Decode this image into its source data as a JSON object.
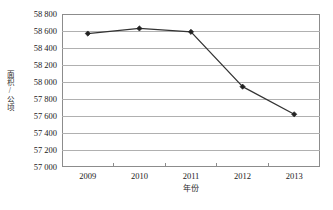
{
  "chart_data": {
    "type": "line",
    "title": "",
    "subtitle": "",
    "xlabel": "年份",
    "ylabel": "面积/公顷",
    "categories": [
      "2009",
      "2010",
      "2011",
      "2012",
      "2013"
    ],
    "x": [
      2009,
      2010,
      2011,
      2012,
      2013
    ],
    "series": [
      {
        "name": "面积",
        "values": [
          58570,
          58630,
          58590,
          57945,
          57620
        ],
        "color": "#333333",
        "marker": "diamond",
        "marker_color": "#222222"
      }
    ],
    "values": [
      58570,
      58630,
      58590,
      57945,
      57620
    ],
    "ylim": [
      57000,
      58800
    ],
    "ytick_step": 200,
    "yticks": [
      57000,
      57200,
      57400,
      57600,
      57800,
      58000,
      58200,
      58400,
      58600,
      58800
    ],
    "ytick_labels": [
      "57 000",
      "57 200",
      "57 400",
      "57 600",
      "57 800",
      "58 000",
      "58 200",
      "58 400",
      "58 600",
      "58 800"
    ],
    "xtick_labels": [
      "2009",
      "2010",
      "2011",
      "2012",
      "2013"
    ],
    "grid": {
      "horizontal": true,
      "vertical": false,
      "color": "#b0b0b0"
    },
    "legend": {
      "visible": false,
      "position": "none",
      "entries": []
    },
    "annotations": [],
    "frame": {
      "border_color": "#8c8c8c",
      "background": "#ffffff"
    }
  }
}
